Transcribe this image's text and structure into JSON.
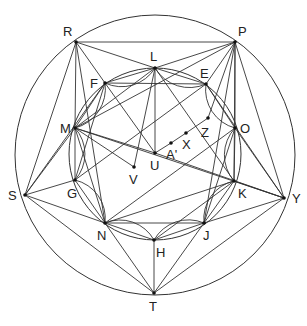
{
  "diagram": {
    "type": "geometry-construction",
    "outer_circle": {
      "cx": 155,
      "cy": 155,
      "r": 140
    },
    "inner_circle": {
      "cx": 155,
      "cy": 154,
      "r": 86
    },
    "points": [
      {
        "id": "R",
        "x": 76,
        "y": 42,
        "lx": 63,
        "ly": 36
      },
      {
        "id": "P",
        "x": 235,
        "y": 42,
        "lx": 238,
        "ly": 36
      },
      {
        "id": "L",
        "x": 155,
        "y": 68,
        "lx": 150,
        "ly": 61
      },
      {
        "id": "F",
        "x": 105,
        "y": 83,
        "lx": 90,
        "ly": 88
      },
      {
        "id": "E",
        "x": 206,
        "y": 84,
        "lx": 200,
        "ly": 78
      },
      {
        "id": "M",
        "x": 75,
        "y": 128,
        "lx": 60,
        "ly": 133
      },
      {
        "id": "O",
        "x": 235,
        "y": 128,
        "lx": 240,
        "ly": 133
      },
      {
        "id": "Z",
        "x": 208,
        "y": 118,
        "lx": 201,
        "ly": 137
      },
      {
        "id": "X",
        "x": 186,
        "y": 133,
        "lx": 182,
        "ly": 149
      },
      {
        "id": "A'",
        "x": 171,
        "y": 143,
        "lx": 166,
        "ly": 159
      },
      {
        "id": "U",
        "x": 155,
        "y": 153,
        "lx": 150,
        "ly": 170
      },
      {
        "id": "V",
        "x": 134,
        "y": 167,
        "lx": 129,
        "ly": 184
      },
      {
        "id": "S",
        "x": 25,
        "y": 195,
        "lx": 8,
        "ly": 200
      },
      {
        "id": "G",
        "x": 75,
        "y": 180,
        "lx": 67,
        "ly": 198
      },
      {
        "id": "K",
        "x": 234,
        "y": 181,
        "lx": 238,
        "ly": 198
      },
      {
        "id": "Y",
        "x": 284,
        "y": 198,
        "lx": 292,
        "ly": 203
      },
      {
        "id": "N",
        "x": 105,
        "y": 223,
        "lx": 97,
        "ly": 240
      },
      {
        "id": "J",
        "x": 204,
        "y": 223,
        "lx": 203,
        "ly": 240
      },
      {
        "id": "H",
        "x": 154,
        "y": 240,
        "lx": 156,
        "ly": 257
      },
      {
        "id": "T",
        "x": 154,
        "y": 293,
        "lx": 149,
        "ly": 311
      }
    ],
    "segments": [
      [
        "R",
        "P"
      ],
      [
        "R",
        "S"
      ],
      [
        "R",
        "M"
      ],
      [
        "R",
        "L"
      ],
      [
        "R",
        "F"
      ],
      [
        "R",
        "N"
      ],
      [
        "P",
        "Y"
      ],
      [
        "P",
        "O"
      ],
      [
        "P",
        "L"
      ],
      [
        "P",
        "E"
      ],
      [
        "P",
        "M"
      ],
      [
        "P",
        "Z"
      ],
      [
        "P",
        "K"
      ],
      [
        "P",
        "J"
      ],
      [
        "S",
        "M"
      ],
      [
        "S",
        "G"
      ],
      [
        "S",
        "N"
      ],
      [
        "S",
        "T"
      ],
      [
        "S",
        "F"
      ],
      [
        "T",
        "N"
      ],
      [
        "T",
        "H"
      ],
      [
        "T",
        "J"
      ],
      [
        "T",
        "Y"
      ],
      [
        "Y",
        "O"
      ],
      [
        "Y",
        "K"
      ],
      [
        "Y",
        "J"
      ],
      [
        "Y",
        "M"
      ],
      [
        "Y",
        "E"
      ],
      [
        "F",
        "E"
      ],
      [
        "N",
        "J"
      ],
      [
        "L",
        "U"
      ],
      [
        "L",
        "V"
      ],
      [
        "L",
        "M"
      ],
      [
        "L",
        "E"
      ],
      [
        "L",
        "K"
      ],
      [
        "M",
        "V"
      ],
      [
        "M",
        "U"
      ],
      [
        "M",
        "N"
      ],
      [
        "F",
        "G"
      ],
      [
        "F",
        "U"
      ],
      [
        "U",
        "A'"
      ],
      [
        "A'",
        "X"
      ],
      [
        "X",
        "Z"
      ],
      [
        "U",
        "Y"
      ],
      [
        "G",
        "N"
      ],
      [
        "N",
        "H"
      ],
      [
        "H",
        "J"
      ],
      [
        "J",
        "K"
      ],
      [
        "K",
        "O"
      ],
      [
        "O",
        "E"
      ],
      [
        "M",
        "G"
      ],
      [
        "F",
        "L"
      ],
      [
        "F",
        "M"
      ],
      [
        "G",
        "E"
      ],
      [
        "N",
        "O"
      ],
      [
        "H",
        "K"
      ],
      [
        "J",
        "O"
      ],
      [
        "N",
        "K"
      ]
    ],
    "arcs": [
      [
        "F",
        "M"
      ],
      [
        "M",
        "G"
      ],
      [
        "G",
        "N"
      ],
      [
        "N",
        "H"
      ],
      [
        "H",
        "J"
      ],
      [
        "J",
        "K"
      ],
      [
        "K",
        "O"
      ],
      [
        "O",
        "E"
      ],
      [
        "L",
        "F"
      ],
      [
        "E",
        "L"
      ]
    ]
  }
}
